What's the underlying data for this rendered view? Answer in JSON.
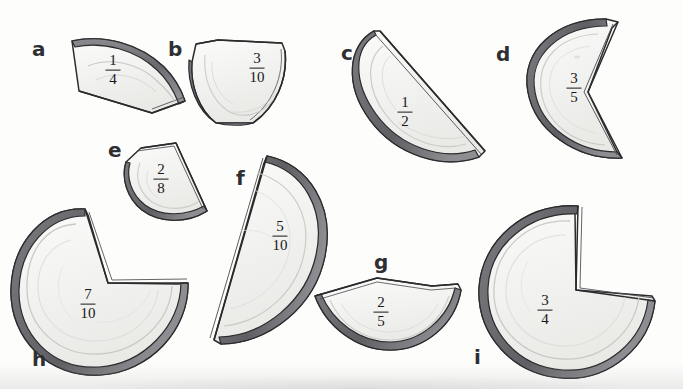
{
  "page": {
    "width": 683,
    "height": 389,
    "background_color": "#fdfdfc",
    "ink_color": "#2b2b2e",
    "rim_color": "#6e6e72",
    "face_color": "#f6f6f4"
  },
  "pieces": [
    {
      "id": "a",
      "label": "a",
      "label_x": 32,
      "label_y": 39,
      "fraction": {
        "numerator": "1",
        "denominator": "4",
        "x": 113,
        "y": 70
      },
      "value": 0.25,
      "shape": "quarter-sector"
    },
    {
      "id": "b",
      "label": "b",
      "label_x": 168,
      "label_y": 39,
      "fraction": {
        "numerator": "3",
        "denominator": "10",
        "x": 257,
        "y": 68
      },
      "value": 0.3,
      "shape": "sector"
    },
    {
      "id": "c",
      "label": "c",
      "label_x": 341,
      "label_y": 43,
      "fraction": {
        "numerator": "1",
        "denominator": "2",
        "x": 405,
        "y": 112
      },
      "value": 0.5,
      "shape": "half-disc"
    },
    {
      "id": "d",
      "label": "d",
      "label_x": 496,
      "label_y": 44,
      "fraction": {
        "numerator": "3",
        "denominator": "5",
        "x": 574,
        "y": 88
      },
      "value": 0.6,
      "shape": "sector"
    },
    {
      "id": "e",
      "label": "e",
      "label_x": 108,
      "label_y": 140,
      "fraction": {
        "numerator": "2",
        "denominator": "8",
        "x": 161,
        "y": 179
      },
      "value": 0.25,
      "shape": "sector"
    },
    {
      "id": "f",
      "label": "f",
      "label_x": 236,
      "label_y": 168,
      "fraction": {
        "numerator": "5",
        "denominator": "10",
        "x": 280,
        "y": 236
      },
      "value": 0.5,
      "shape": "half-disc"
    },
    {
      "id": "g",
      "label": "g",
      "label_x": 374,
      "label_y": 252,
      "fraction": {
        "numerator": "2",
        "denominator": "5",
        "x": 381,
        "y": 312
      },
      "value": 0.4,
      "shape": "sector"
    },
    {
      "id": "h",
      "label": "h",
      "label_x": 32,
      "label_y": 349,
      "fraction": {
        "numerator": "7",
        "denominator": "10",
        "x": 88,
        "y": 304
      },
      "value": 0.7,
      "shape": "major-sector"
    },
    {
      "id": "i",
      "label": "i",
      "label_x": 474,
      "label_y": 347,
      "fraction": {
        "numerator": "3",
        "denominator": "4",
        "x": 545,
        "y": 310
      },
      "value": 0.75,
      "shape": "three-quarter-disc"
    }
  ]
}
